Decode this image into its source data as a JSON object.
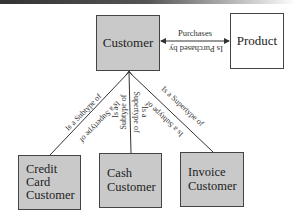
{
  "entities": {
    "customer": {
      "label": "Customer",
      "fill": "#c9c9c9"
    },
    "product": {
      "label": "Product",
      "fill": "#ffffff"
    },
    "credit_card_customer": {
      "label": "Credit Card Customer",
      "lines": [
        "Credit",
        "Card",
        "Customer"
      ],
      "fill": "#c9c9c9"
    },
    "cash_customer": {
      "label": "Cash Customer",
      "lines": [
        "Cash",
        "Customer"
      ],
      "fill": "#c9c9c9"
    },
    "invoice_customer": {
      "label": "Invoice Customer",
      "lines": [
        "Invoice",
        "Customer"
      ],
      "fill": "#c9c9c9"
    }
  },
  "relationships": {
    "purchases": {
      "forward": "Purchases",
      "reverse": "Is Purchased by"
    },
    "credit_card": {
      "forward": "Is a Subtype of",
      "reverse": "Is a Supertype of"
    },
    "cash": {
      "forward": "Is a Subtype of",
      "reverse": "Is a Supertype of",
      "forward_lines": [
        "Is a",
        "Subtype of"
      ],
      "reverse_lines": [
        "Is a",
        "Supertype of"
      ]
    },
    "invoice": {
      "forward": "Is a Supertype of",
      "reverse": "Is a Subtype of"
    }
  }
}
